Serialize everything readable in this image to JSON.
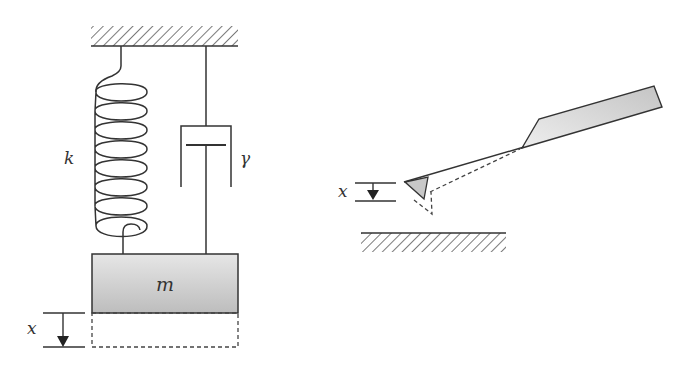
{
  "figure": {
    "left_panel": {
      "title": "spring-mass-damper model",
      "spring_label": "k",
      "damper_label": "γ",
      "mass_label": "m",
      "displacement_label": "x"
    },
    "right_panel": {
      "title": "AFM cantilever with tip above surface",
      "displacement_label": "x"
    },
    "colors": {
      "stroke": "#333333",
      "mass_fill_light": "#e6e6e6",
      "mass_fill_dark": "#bdbdbd",
      "chip_fill_light": "#eeeeee",
      "chip_fill_dark": "#c4c4c4",
      "arrow": "#222222"
    }
  }
}
